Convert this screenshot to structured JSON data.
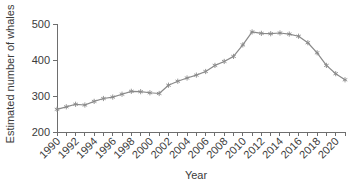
{
  "chart_data": {
    "type": "line",
    "title": "",
    "xlabel": "Year",
    "ylabel": "Estimated number of whales",
    "xlim": [
      1990,
      2021
    ],
    "ylim": [
      200,
      500
    ],
    "grid": false,
    "legend": null,
    "marker": "asterisk",
    "line_color": "#8a8a8a",
    "x": [
      1990,
      1991,
      1992,
      1993,
      1994,
      1995,
      1996,
      1997,
      1998,
      1999,
      2000,
      2001,
      2002,
      2003,
      2004,
      2005,
      2006,
      2007,
      2008,
      2009,
      2010,
      2011,
      2012,
      2013,
      2014,
      2015,
      2016,
      2017,
      2018,
      2019,
      2020,
      2021
    ],
    "values": [
      263,
      270,
      277,
      275,
      285,
      293,
      297,
      305,
      313,
      312,
      309,
      307,
      330,
      341,
      350,
      358,
      368,
      385,
      396,
      410,
      442,
      478,
      474,
      473,
      475,
      472,
      466,
      448,
      420,
      385,
      362,
      345
    ],
    "x_tick_labels": [
      "1990",
      "1992",
      "1994",
      "1996",
      "1998",
      "2000",
      "2002",
      "2004",
      "2006",
      "2008",
      "2010",
      "2012",
      "2014",
      "2016",
      "2018",
      "2020"
    ],
    "x_tick_values": [
      1990,
      1992,
      1994,
      1996,
      1998,
      2000,
      2002,
      2004,
      2006,
      2008,
      2010,
      2012,
      2014,
      2016,
      2018,
      2020
    ],
    "x_minor_ticks": [
      1990,
      1991,
      1992,
      1993,
      1994,
      1995,
      1996,
      1997,
      1998,
      1999,
      2000,
      2001,
      2002,
      2003,
      2004,
      2005,
      2006,
      2007,
      2008,
      2009,
      2010,
      2011,
      2012,
      2013,
      2014,
      2015,
      2016,
      2017,
      2018,
      2019,
      2020,
      2021
    ],
    "y_tick_labels": [
      "200",
      "300",
      "400",
      "500"
    ],
    "y_tick_values": [
      200,
      300,
      400,
      500
    ]
  }
}
